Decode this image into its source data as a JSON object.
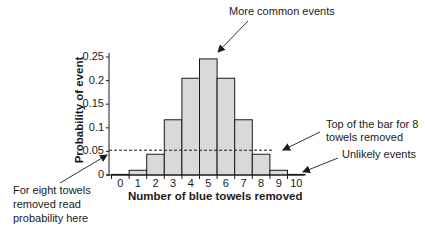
{
  "chart_data": {
    "type": "bar",
    "title": "",
    "xlabel": "Number of blue towels removed",
    "ylabel": "Probability of event",
    "categories": [
      "0",
      "1",
      "2",
      "3",
      "4",
      "5",
      "6",
      "7",
      "8",
      "9",
      "10"
    ],
    "values": [
      0.001,
      0.01,
      0.044,
      0.117,
      0.205,
      0.246,
      0.205,
      0.117,
      0.044,
      0.01,
      0.001
    ],
    "yticks": [
      "0",
      "0.05",
      "0.1",
      "0.15",
      "0.2",
      "0.25"
    ],
    "ylim": [
      0,
      0.25
    ],
    "grid": false,
    "reference_line": {
      "y": 0.044,
      "style": "dashed",
      "from_category": "0",
      "to_category": "8"
    },
    "bar_fill": "#d9d9d9",
    "bar_stroke": "#1a1a1a",
    "annotations": [
      {
        "text": "More common events",
        "points_to": "top of bar 5"
      },
      {
        "text": "Top of the bar for 8 towels removed",
        "points_to": "dashed line end at bar 8"
      },
      {
        "text": "Unlikely events",
        "points_to": "bar 10"
      },
      {
        "text": "For eight towels removed read probability here",
        "points_to": "y-axis at 0.044"
      }
    ]
  },
  "annotations": {
    "common": "More common events",
    "top8_line1": "Top of the bar for 8",
    "top8_line2": "towels removed",
    "unlikely": "Unlikely events",
    "read_line1": "For eight towels",
    "read_line2": "removed read",
    "read_line3": "probability here"
  }
}
